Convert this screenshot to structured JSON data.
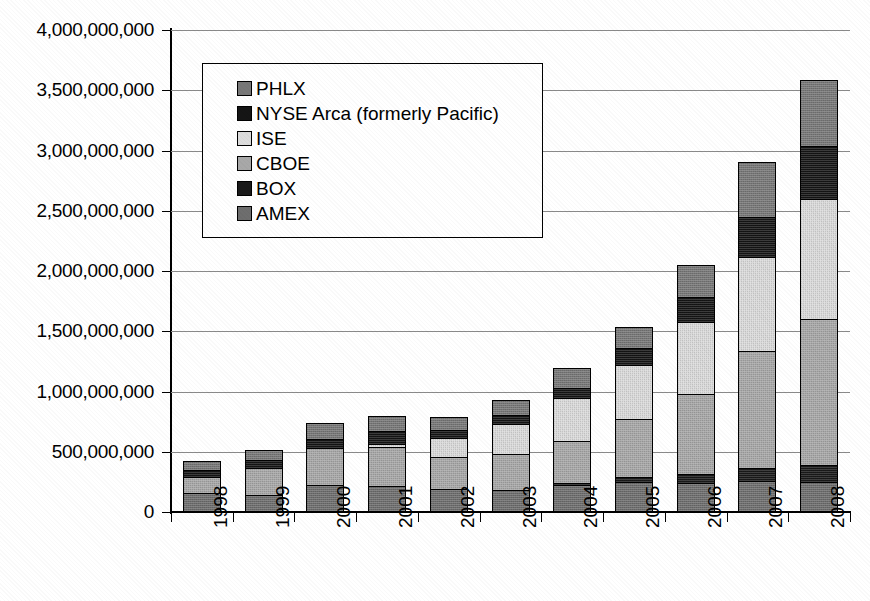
{
  "chart_data": {
    "type": "bar",
    "subtype": "stacked-vertical",
    "title": "",
    "subtitle": "",
    "xlabel": "",
    "ylabel": "",
    "grid": true,
    "legend_position": "inside-top-left",
    "categories": [
      "1998",
      "1999",
      "2000",
      "2001",
      "2002",
      "2003",
      "2004",
      "2005",
      "2006",
      "2007",
      "2008"
    ],
    "ylim": [
      0,
      4000000000
    ],
    "ytick_step": 500000000,
    "ytick_labels": [
      "4,000,000,000",
      "3,500,000,000",
      "3,000,000,000",
      "2,500,000,000",
      "2,000,000,000",
      "1,500,000,000",
      "1,000,000,000",
      "500,000,000",
      "0"
    ],
    "ytick_values": [
      4000000000,
      3500000000,
      3000000000,
      2500000000,
      2000000000,
      1500000000,
      1000000000,
      500000000,
      0
    ],
    "stack_order_bottom_to_top": [
      "AMEX",
      "BOX",
      "CBOE",
      "ISE",
      "NYSE Arca (formerly Pacific)",
      "PHLX"
    ],
    "series": [
      {
        "name": "AMEX",
        "color": "#6e6e6e",
        "values": [
          150000000,
          130000000,
          220000000,
          205000000,
          180000000,
          175000000,
          215000000,
          240000000,
          230000000,
          245000000,
          240000000
        ]
      },
      {
        "name": "BOX",
        "color": "#1a1a1a",
        "values": [
          0,
          0,
          0,
          0,
          0,
          0,
          20000000,
          45000000,
          75000000,
          110000000,
          145000000
        ]
      },
      {
        "name": "CBOE",
        "color": "#a8a8a8",
        "values": [
          130000000,
          230000000,
          300000000,
          330000000,
          270000000,
          300000000,
          350000000,
          475000000,
          670000000,
          975000000,
          1205000000
        ]
      },
      {
        "name": "ISE",
        "color": "#dcdcdc",
        "values": [
          0,
          0,
          0,
          25000000,
          155000000,
          245000000,
          350000000,
          455000000,
          590000000,
          780000000,
          1000000000
        ]
      },
      {
        "name": "NYSE Arca (formerly Pacific)",
        "color": "#151515",
        "values": [
          60000000,
          60000000,
          80000000,
          105000000,
          70000000,
          75000000,
          85000000,
          135000000,
          210000000,
          330000000,
          440000000
        ]
      },
      {
        "name": "PHLX",
        "color": "#787878",
        "values": [
          70000000,
          80000000,
          125000000,
          120000000,
          105000000,
          120000000,
          165000000,
          175000000,
          265000000,
          450000000,
          545000000
        ]
      }
    ],
    "totals": [
      410000000,
      500000000,
      725000000,
      785000000,
      780000000,
      915000000,
      1185000000,
      1525000000,
      2040000000,
      2890000000,
      3575000000
    ]
  },
  "legend": {
    "entries": [
      {
        "label": "PHLX",
        "swatch": "#787878"
      },
      {
        "label": "NYSE Arca (formerly Pacific)",
        "swatch": "#151515"
      },
      {
        "label": "ISE",
        "swatch": "#dcdcdc"
      },
      {
        "label": "CBOE",
        "swatch": "#a8a8a8"
      },
      {
        "label": "BOX",
        "swatch": "#1a1a1a"
      },
      {
        "label": "AMEX",
        "swatch": "#6e6e6e"
      }
    ]
  }
}
